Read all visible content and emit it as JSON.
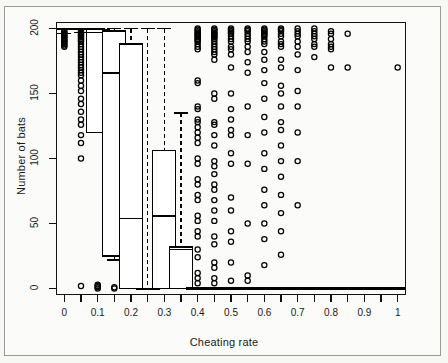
{
  "figure": {
    "xlabel": "Cheating rate",
    "ylabel": "Number of bats"
  },
  "chart_data": {
    "type": "boxplot",
    "title": "",
    "xlabel": "Cheating rate",
    "ylabel": "Number of bats",
    "xlim": [
      -0.025,
      1.025
    ],
    "ylim": [
      -5,
      205
    ],
    "xticks": [
      0,
      0.05,
      0.1,
      0.15,
      0.2,
      0.25,
      0.3,
      0.35,
      0.4,
      0.45,
      0.5,
      0.55,
      0.6,
      0.65,
      0.7,
      0.75,
      0.8,
      0.85,
      0.9,
      0.95,
      1
    ],
    "xticklabels": [
      "0",
      "",
      "0.1",
      "",
      "0.2",
      "",
      "0.3",
      "",
      "0.4",
      "",
      "0.5",
      "",
      "0.6",
      "",
      "0.7",
      "",
      "0.8",
      "",
      "0.9",
      "",
      "1"
    ],
    "yticks": [
      0,
      50,
      100,
      150,
      200
    ],
    "yticklabels": [
      "0",
      "50",
      "100",
      "150",
      "200"
    ],
    "grid": false,
    "legend": null,
    "box_color": "#ffffff",
    "line_color": "#000000",
    "groups": [
      {
        "x": 0.0,
        "whisker_low": 196,
        "q1": 199,
        "median": 200,
        "q3": 200,
        "whisker_high": 200,
        "outliers": [
          198,
          197,
          196,
          195,
          194,
          193,
          192,
          191,
          190,
          189,
          188,
          187,
          186
        ]
      },
      {
        "x": 0.05,
        "whisker_low": 197,
        "q1": 199,
        "median": 200,
        "q3": 200,
        "whisker_high": 200,
        "outliers": [
          198,
          197,
          196,
          195,
          194,
          193,
          192,
          191,
          190,
          188,
          186,
          184,
          182,
          180,
          178,
          176,
          174,
          172,
          170,
          168,
          166,
          164,
          160,
          156,
          152,
          146,
          142,
          136,
          130,
          126,
          118,
          112,
          100,
          2
        ]
      },
      {
        "x": 0.1,
        "whisker_low": 120,
        "q1": 120,
        "median": 197,
        "q3": 199,
        "whisker_high": 200,
        "outliers": [
          3,
          2,
          1,
          0
        ]
      },
      {
        "x": 0.15,
        "whisker_low": 22,
        "q1": 25,
        "median": 166,
        "q3": 198,
        "whisker_high": 200,
        "outliers": [
          1,
          0
        ]
      },
      {
        "x": 0.2,
        "whisker_low": 0,
        "q1": 0,
        "median": 54,
        "q3": 188,
        "whisker_high": 200,
        "outliers": []
      },
      {
        "x": 0.25,
        "whisker_low": 0,
        "q1": 0,
        "median": 0,
        "q3": 0,
        "whisker_high": 200,
        "outliers": []
      },
      {
        "x": 0.3,
        "whisker_low": 0,
        "q1": 0,
        "median": 56,
        "q3": 106,
        "whisker_high": 200,
        "outliers": []
      },
      {
        "x": 0.35,
        "whisker_low": 0,
        "q1": 0,
        "median": 30,
        "q3": 32,
        "whisker_high": 135,
        "outliers": []
      },
      {
        "x": 0.4,
        "whisker_low": 0,
        "q1": 0,
        "median": 0,
        "q3": 0,
        "whisker_high": 0,
        "outliers": [
          200,
          199,
          198,
          197,
          196,
          195,
          194,
          193,
          192,
          191,
          190,
          188,
          186,
          184,
          160,
          158,
          140,
          138,
          130,
          128,
          124,
          120,
          116,
          112,
          100,
          96,
          84,
          80,
          72,
          68,
          56,
          52,
          44,
          40,
          30,
          24,
          12,
          8,
          4
        ]
      },
      {
        "x": 0.45,
        "whisker_low": 0,
        "q1": 0,
        "median": 0,
        "q3": 0,
        "whisker_high": 0,
        "outliers": [
          200,
          199,
          198,
          197,
          196,
          195,
          194,
          193,
          192,
          190,
          188,
          186,
          184,
          182,
          180,
          176,
          150,
          146,
          128,
          126,
          118,
          110,
          98,
          94,
          88,
          80,
          76,
          68,
          60,
          52,
          40,
          34,
          20,
          16,
          8,
          4
        ]
      },
      {
        "x": 0.5,
        "whisker_low": 0,
        "q1": 0,
        "median": 0,
        "q3": 0,
        "whisker_high": 0,
        "outliers": [
          200,
          199,
          198,
          197,
          196,
          194,
          192,
          190,
          186,
          184,
          180,
          170,
          150,
          138,
          130,
          122,
          118,
          104,
          96,
          70,
          60,
          44,
          36,
          20,
          6
        ]
      },
      {
        "x": 0.55,
        "whisker_low": 0,
        "q1": 0,
        "median": 0,
        "q3": 0,
        "whisker_high": 0,
        "outliers": [
          200,
          199,
          198,
          196,
          194,
          192,
          190,
          186,
          182,
          174,
          166,
          140,
          118,
          96,
          50,
          10,
          6
        ]
      },
      {
        "x": 0.6,
        "whisker_low": 0,
        "q1": 0,
        "median": 0,
        "q3": 0,
        "whisker_high": 0,
        "outliers": [
          200,
          199,
          198,
          197,
          196,
          195,
          194,
          192,
          190,
          188,
          182,
          176,
          168,
          158,
          146,
          132,
          120,
          104,
          92,
          76,
          64,
          50,
          38,
          18
        ]
      },
      {
        "x": 0.65,
        "whisker_low": 0,
        "q1": 0,
        "median": 0,
        "q3": 0,
        "whisker_high": 0,
        "outliers": [
          200,
          199,
          198,
          196,
          194,
          190,
          188,
          186,
          176,
          170,
          156,
          150,
          140,
          128,
          122,
          110,
          98,
          86,
          72,
          58,
          44,
          26
        ]
      },
      {
        "x": 0.7,
        "whisker_low": 0,
        "q1": 0,
        "median": 0,
        "q3": 0,
        "whisker_high": 0,
        "outliers": [
          200,
          198,
          196,
          194,
          190,
          186,
          180,
          168,
          152,
          140,
          120,
          98,
          64
        ]
      },
      {
        "x": 0.75,
        "whisker_low": 0,
        "q1": 0,
        "median": 0,
        "q3": 0,
        "whisker_high": 0,
        "outliers": [
          200,
          198,
          196,
          194,
          192,
          188,
          186,
          178
        ]
      },
      {
        "x": 0.8,
        "whisker_low": 0,
        "q1": 0,
        "median": 0,
        "q3": 0,
        "whisker_high": 0,
        "outliers": [
          198,
          196,
          192,
          188,
          186,
          184,
          170
        ]
      },
      {
        "x": 0.85,
        "whisker_low": 0,
        "q1": 0,
        "median": 0,
        "q3": 0,
        "whisker_high": 0,
        "outliers": [
          196,
          170
        ]
      },
      {
        "x": 0.9,
        "whisker_low": 0,
        "q1": 0,
        "median": 0,
        "q3": 0,
        "whisker_high": 0,
        "outliers": []
      },
      {
        "x": 0.95,
        "whisker_low": 0,
        "q1": 0,
        "median": 0,
        "q3": 0,
        "whisker_high": 0,
        "outliers": []
      },
      {
        "x": 1.0,
        "whisker_low": 0,
        "q1": 0,
        "median": 0,
        "q3": 0,
        "whisker_high": 0,
        "outliers": [
          170
        ]
      }
    ]
  }
}
